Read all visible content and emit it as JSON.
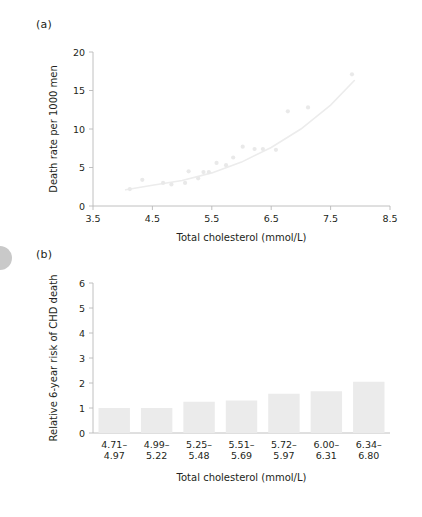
{
  "figure": {
    "panel_a_tag": "(a)",
    "panel_b_tag": "(b)"
  },
  "chart_data": [
    {
      "id": "panel_a",
      "type": "scatter",
      "title": "",
      "xlabel": "Total cholesterol (mmol/L)",
      "ylabel": "Death rate per 1000 men",
      "xlim": [
        3.5,
        8.5
      ],
      "ylim": [
        0,
        20
      ],
      "xticks": [
        3.5,
        4.5,
        5.5,
        6.5,
        7.5,
        8.5
      ],
      "xtick_labels": [
        "3.5",
        "4.5",
        "5.5",
        "6.5",
        "7.5",
        "8.5"
      ],
      "yticks": [
        0,
        5,
        10,
        15,
        20
      ],
      "ytick_labels": [
        "0",
        "5",
        "10",
        "15",
        "20"
      ],
      "grid": false,
      "legend": null,
      "marker_color": "#e9e9e9",
      "line_color": "#ececec",
      "axis_color": "#b9b9b9",
      "points": [
        {
          "x": 4.12,
          "y": 2.2
        },
        {
          "x": 4.33,
          "y": 3.4
        },
        {
          "x": 4.68,
          "y": 3.0
        },
        {
          "x": 4.82,
          "y": 2.8
        },
        {
          "x": 5.05,
          "y": 3.0
        },
        {
          "x": 5.11,
          "y": 4.5
        },
        {
          "x": 5.27,
          "y": 3.6
        },
        {
          "x": 5.36,
          "y": 4.4
        },
        {
          "x": 5.45,
          "y": 4.4
        },
        {
          "x": 5.58,
          "y": 5.6
        },
        {
          "x": 5.74,
          "y": 5.3
        },
        {
          "x": 5.86,
          "y": 6.3
        },
        {
          "x": 6.02,
          "y": 7.7
        },
        {
          "x": 6.22,
          "y": 7.4
        },
        {
          "x": 6.36,
          "y": 7.4
        },
        {
          "x": 6.58,
          "y": 7.3
        },
        {
          "x": 6.78,
          "y": 12.3
        },
        {
          "x": 7.12,
          "y": 12.8
        },
        {
          "x": 7.86,
          "y": 17.1
        }
      ],
      "fit_curve": [
        {
          "x": 4.05,
          "y": 2.1
        },
        {
          "x": 4.5,
          "y": 2.7
        },
        {
          "x": 5.0,
          "y": 3.3
        },
        {
          "x": 5.5,
          "y": 4.3
        },
        {
          "x": 6.0,
          "y": 5.7
        },
        {
          "x": 6.5,
          "y": 7.6
        },
        {
          "x": 7.0,
          "y": 10.0
        },
        {
          "x": 7.5,
          "y": 13.1
        },
        {
          "x": 7.9,
          "y": 16.3
        }
      ]
    },
    {
      "id": "panel_b",
      "type": "bar",
      "title": "",
      "xlabel": "Total cholesterol (mmol/L)",
      "ylabel": "Relative 6-year risk of CHD death",
      "categories": [
        "4.71–\n4.97",
        "4.99–\n5.22",
        "5.25–\n5.48",
        "5.51–\n5.69",
        "5.72–\n5.97",
        "6.00–\n6.31",
        "6.34–\n6.80"
      ],
      "category_lines": [
        [
          "4.71–",
          "4.97"
        ],
        [
          "4.99–",
          "5.22"
        ],
        [
          "5.25–",
          "5.48"
        ],
        [
          "5.51–",
          "5.69"
        ],
        [
          "5.72–",
          "5.97"
        ],
        [
          "6.00–",
          "6.31"
        ],
        [
          "6.34–",
          "6.80"
        ]
      ],
      "values": [
        1.0,
        1.0,
        1.25,
        1.3,
        1.57,
        1.67,
        2.05
      ],
      "ylim": [
        0,
        6
      ],
      "yticks": [
        0,
        1,
        2,
        3,
        4,
        5,
        6
      ],
      "ytick_labels": [
        "0",
        "1",
        "2",
        "3",
        "4",
        "5",
        "6"
      ],
      "grid": false,
      "legend": null,
      "bar_color": "#ebebeb",
      "axis_color": "#b9b9b9"
    }
  ]
}
